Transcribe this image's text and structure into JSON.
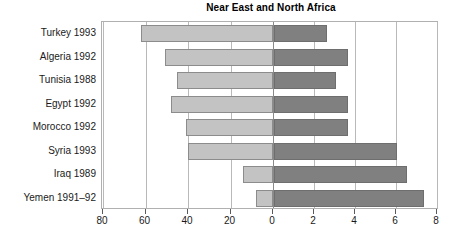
{
  "chart_data": {
    "type": "bar",
    "title": "Near East and North Africa",
    "subtitle": "",
    "orientation": "horizontal",
    "layout": "bidirectional-butterfly",
    "xlabel": "",
    "ylabel": "",
    "grid": true,
    "legend_position": "none",
    "categories": [
      "Turkey 1993",
      "Algeria 1992",
      "Tunisia 1988",
      "Egypt 1992",
      "Morocco 1992",
      "Syria 1993",
      "Iraq 1989",
      "Yemen 1991–92"
    ],
    "series": [
      {
        "name": "left",
        "direction": "left",
        "color": "#c3c3c3",
        "axis_range": [
          0,
          80
        ],
        "axis_reversed": true,
        "axis_ticks": [
          80,
          60,
          40,
          20,
          0
        ],
        "values": [
          62,
          51,
          45,
          48,
          41,
          40,
          14,
          8
        ]
      },
      {
        "name": "right",
        "direction": "right",
        "color": "#808080",
        "axis_range": [
          0,
          8
        ],
        "axis_reversed": false,
        "axis_ticks": [
          0,
          2,
          4,
          6,
          8
        ],
        "values": [
          2.6,
          3.6,
          3.0,
          3.6,
          3.6,
          6.0,
          6.5,
          7.3
        ]
      }
    ],
    "axis_left_ticks": [
      "80",
      "60",
      "40",
      "20",
      "0"
    ],
    "axis_right_ticks": [
      "0",
      "2",
      "4",
      "6",
      "8"
    ]
  },
  "colors": {
    "left_bar": "#c3c3c3",
    "left_bar_border": "#8c8c8c",
    "right_bar": "#808080",
    "right_bar_border": "#6e6e6e",
    "gridline": "#b9b9b9",
    "frame": "#b0b0b0",
    "text": "#1a1a1a",
    "background": "#ffffff"
  }
}
